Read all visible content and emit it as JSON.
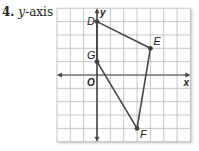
{
  "problem": {
    "number": "4.",
    "text": "y-axis",
    "text_italic_part": "y",
    "text_rest": "-axis"
  },
  "graph": {
    "x_range": [
      -3,
      7
    ],
    "y_range": [
      -5,
      5
    ],
    "axis_labels": {
      "x": "x",
      "y": "y",
      "origin": "O"
    },
    "colors": {
      "grid": "#b8b8b8",
      "axis": "#444444",
      "polygon": "#444444",
      "point": "#444444"
    },
    "points": [
      {
        "label": "D",
        "x": 0,
        "y": 4
      },
      {
        "label": "E",
        "x": 4,
        "y": 2
      },
      {
        "label": "F",
        "x": 3,
        "y": -4
      },
      {
        "label": "G",
        "x": 0,
        "y": 1
      }
    ],
    "polygon_order": [
      "D",
      "E",
      "F",
      "G"
    ]
  }
}
